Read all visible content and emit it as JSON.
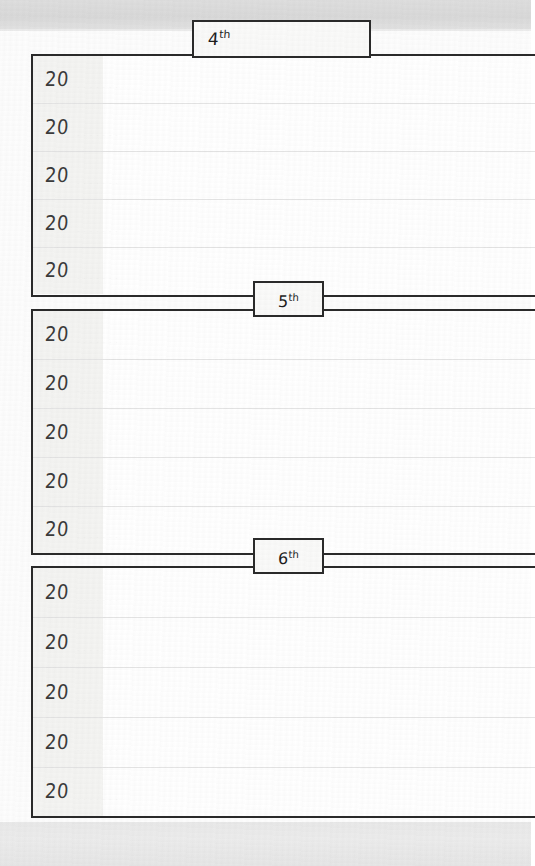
{
  "page": {
    "type": "five-year-memory-book-planner-page",
    "paper_color": "#fdfdfd",
    "scan_band_top_color": "#d9d9d9",
    "scan_band_bottom_color": "#e9e9e9",
    "rule_color": "#2a2a2a",
    "gutter_shade_color": "#f4f4f2",
    "year_prefix": "20"
  },
  "sections": [
    {
      "day_number": "4",
      "day_suffix": "th",
      "tab_has_title_line": true,
      "rows": [
        {
          "year_prefix": "20",
          "year_value": "",
          "entry_text": ""
        },
        {
          "year_prefix": "20",
          "year_value": "",
          "entry_text": ""
        },
        {
          "year_prefix": "20",
          "year_value": "",
          "entry_text": ""
        },
        {
          "year_prefix": "20",
          "year_value": "",
          "entry_text": ""
        },
        {
          "year_prefix": "20",
          "year_value": "",
          "entry_text": ""
        }
      ]
    },
    {
      "day_number": "5",
      "day_suffix": "th",
      "tab_has_title_line": false,
      "rows": [
        {
          "year_prefix": "20",
          "year_value": "",
          "entry_text": ""
        },
        {
          "year_prefix": "20",
          "year_value": "",
          "entry_text": ""
        },
        {
          "year_prefix": "20",
          "year_value": "",
          "entry_text": ""
        },
        {
          "year_prefix": "20",
          "year_value": "",
          "entry_text": ""
        },
        {
          "year_prefix": "20",
          "year_value": "",
          "entry_text": ""
        }
      ]
    },
    {
      "day_number": "6",
      "day_suffix": "th",
      "tab_has_title_line": false,
      "rows": [
        {
          "year_prefix": "20",
          "year_value": "",
          "entry_text": ""
        },
        {
          "year_prefix": "20",
          "year_value": "",
          "entry_text": ""
        },
        {
          "year_prefix": "20",
          "year_value": "",
          "entry_text": ""
        },
        {
          "year_prefix": "20",
          "year_value": "",
          "entry_text": ""
        },
        {
          "year_prefix": "20",
          "year_value": "",
          "entry_text": ""
        }
      ]
    }
  ]
}
